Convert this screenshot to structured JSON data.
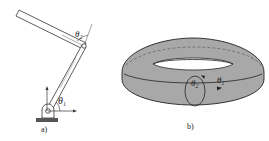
{
  "figure_a": {
    "caption": "a)",
    "theta1": "θ",
    "theta1_sub": "1",
    "theta2": "θ",
    "theta2_sub": "2"
  },
  "figure_b": {
    "caption": "b)",
    "theta1": "θ",
    "theta1_sub": "1",
    "theta2": "θ",
    "theta2_sub": "2"
  },
  "colors": {
    "torus_fill": "#a8a8a8",
    "stroke": "#222222",
    "base": "#555555"
  }
}
